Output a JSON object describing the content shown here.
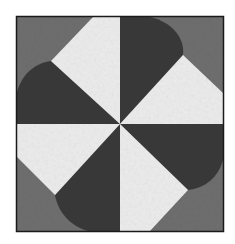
{
  "figure": {
    "colors": {
      "background": "#6f6f6f",
      "dark": "#393939",
      "light": "#ececec",
      "frame": "#1a1a1a",
      "page": "#ffffff"
    }
  }
}
